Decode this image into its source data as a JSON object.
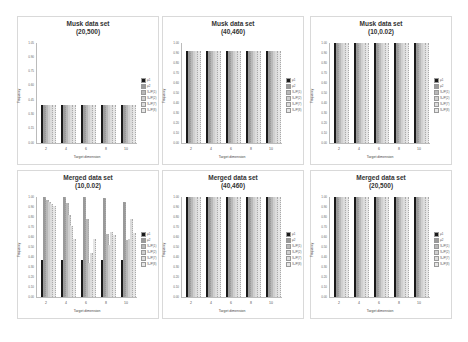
{
  "panels": [
    {
      "id": "p1",
      "title1": "Musk data set",
      "title2": "(20,500)",
      "x": 17,
      "y": 16,
      "ymax": 1.05,
      "yticks": [
        "0.00",
        "0.15",
        "0.30",
        "0.45",
        "0.60",
        "0.75",
        "0.90",
        "1.05"
      ]
    },
    {
      "id": "p2",
      "title1": "Musk data set",
      "title2": "(40,460)",
      "x": 162,
      "y": 16,
      "ymax": 1.0,
      "yticks": [
        "0.00",
        "0.10",
        "0.20",
        "0.30",
        "0.40",
        "0.50",
        "0.60",
        "0.70",
        "0.80",
        "0.90",
        "1.00"
      ]
    },
    {
      "id": "p3",
      "title1": "Musk data set",
      "title2": "(10,0.02)",
      "x": 310,
      "y": 16,
      "ymax": 1.0,
      "yticks": [
        "0.00",
        "0.10",
        "0.20",
        "0.30",
        "0.40",
        "0.50",
        "0.60",
        "0.70",
        "0.80",
        "0.90",
        "1.00"
      ]
    },
    {
      "id": "p4",
      "title1": "Merged data set",
      "title2": "(10,0.02)",
      "x": 17,
      "y": 170,
      "ymax": 1.0,
      "yticks": [
        "0.00",
        "0.10",
        "0.20",
        "0.30",
        "0.40",
        "0.50",
        "0.60",
        "0.70",
        "0.80",
        "0.90",
        "1.00"
      ]
    },
    {
      "id": "p5",
      "title1": "Merged data set",
      "title2": "(40,460)",
      "x": 162,
      "y": 170,
      "ymax": 1.0,
      "yticks": [
        "0.00",
        "0.10",
        "0.20",
        "0.30",
        "0.40",
        "0.50",
        "0.60",
        "0.70",
        "0.80",
        "0.90",
        "1.00"
      ]
    },
    {
      "id": "p6",
      "title1": "Merged data set",
      "title2": "(20,500)",
      "x": 310,
      "y": 170,
      "ymax": 1.0,
      "yticks": [
        "0.00",
        "0.10",
        "0.20",
        "0.30",
        "0.40",
        "0.50",
        "0.60",
        "0.70",
        "0.80",
        "0.90",
        "1.00"
      ]
    }
  ],
  "legend": [
    "μ1",
    "μ2",
    "S₁/P(1)",
    "S₁/P(2)",
    "S₁/P(7)",
    "S₁/P(8)"
  ],
  "series_colors": [
    "#1a1a1a",
    "#9a9a9a",
    "#b8b8b8",
    "#cfcfcf",
    "#dcdcdc",
    "#e6e6e6"
  ],
  "xlabel": "Target dimension",
  "ylabel": "Frequency",
  "chart_data": [
    {
      "type": "bar",
      "title": "Musk data set (20,500)",
      "xlabel": "Target dimension",
      "ylabel": "Frequency",
      "categories": [
        "2",
        "4",
        "6",
        "8",
        "10"
      ],
      "ylim": [
        0,
        1.05
      ],
      "legend_position": "right",
      "series": [
        {
          "name": "μ1",
          "values": [
            0.4,
            0.4,
            0.4,
            0.4,
            0.4
          ]
        },
        {
          "name": "μ2",
          "values": [
            0.4,
            0.4,
            0.4,
            0.4,
            0.4
          ]
        },
        {
          "name": "S₁/P(1)",
          "values": [
            0.4,
            0.4,
            0.4,
            0.4,
            0.4
          ]
        },
        {
          "name": "S₁/P(2)",
          "values": [
            0.4,
            0.4,
            0.4,
            0.4,
            0.4
          ]
        },
        {
          "name": "S₁/P(7)",
          "values": [
            0.4,
            0.4,
            0.4,
            0.4,
            0.4
          ]
        },
        {
          "name": "S₁/P(8)",
          "values": [
            0.4,
            0.4,
            0.4,
            0.4,
            0.4
          ]
        }
      ]
    },
    {
      "type": "bar",
      "title": "Musk data set (40,460)",
      "xlabel": "Target dimension",
      "ylabel": "Frequency",
      "categories": [
        "2",
        "4",
        "6",
        "8",
        "10"
      ],
      "ylim": [
        0,
        1.0
      ],
      "legend_position": "right",
      "series": [
        {
          "name": "μ1",
          "values": [
            0.92,
            0.92,
            0.92,
            0.92,
            0.92
          ]
        },
        {
          "name": "μ2",
          "values": [
            0.92,
            0.92,
            0.92,
            0.92,
            0.92
          ]
        },
        {
          "name": "S₁/P(1)",
          "values": [
            0.92,
            0.92,
            0.92,
            0.92,
            0.92
          ]
        },
        {
          "name": "S₁/P(2)",
          "values": [
            0.92,
            0.92,
            0.92,
            0.92,
            0.92
          ]
        },
        {
          "name": "S₁/P(7)",
          "values": [
            0.92,
            0.92,
            0.92,
            0.92,
            0.92
          ]
        },
        {
          "name": "S₁/P(8)",
          "values": [
            0.92,
            0.92,
            0.92,
            0.92,
            0.92
          ]
        }
      ]
    },
    {
      "type": "bar",
      "title": "Musk data set (10,0.02)",
      "xlabel": "Target dimension",
      "ylabel": "Frequency",
      "categories": [
        "2",
        "4",
        "6",
        "8",
        "10"
      ],
      "ylim": [
        0,
        1.0
      ],
      "legend_position": "right",
      "series": [
        {
          "name": "μ1",
          "values": [
            1.0,
            1.0,
            1.0,
            1.0,
            1.0
          ]
        },
        {
          "name": "μ2",
          "values": [
            1.0,
            1.0,
            1.0,
            1.0,
            1.0
          ]
        },
        {
          "name": "S₁/P(1)",
          "values": [
            1.0,
            1.0,
            1.0,
            1.0,
            1.0
          ]
        },
        {
          "name": "S₁/P(2)",
          "values": [
            1.0,
            1.0,
            1.0,
            1.0,
            1.0
          ]
        },
        {
          "name": "S₁/P(7)",
          "values": [
            1.0,
            1.0,
            1.0,
            1.0,
            1.0
          ]
        },
        {
          "name": "S₁/P(8)",
          "values": [
            1.0,
            1.0,
            1.0,
            1.0,
            1.0
          ]
        }
      ]
    },
    {
      "type": "bar",
      "title": "Merged data set (10,0.02)",
      "xlabel": "Target dimension",
      "ylabel": "Frequency",
      "categories": [
        "2",
        "4",
        "6",
        "8",
        "10"
      ],
      "ylim": [
        0,
        1.0
      ],
      "legend_position": "right",
      "series": [
        {
          "name": "μ1",
          "values": [
            0.37,
            0.37,
            0.37,
            0.37,
            0.37
          ]
        },
        {
          "name": "μ2",
          "values": [
            1.0,
            1.0,
            1.0,
            0.99,
            0.95
          ]
        },
        {
          "name": "S₁/P(1)",
          "values": [
            0.97,
            0.94,
            0.78,
            0.63,
            0.57
          ]
        },
        {
          "name": "S₁/P(2)",
          "values": [
            0.95,
            0.82,
            0.34,
            0.52,
            0.58
          ]
        },
        {
          "name": "S₁/P(7)",
          "values": [
            0.93,
            0.71,
            0.44,
            0.65,
            0.78
          ]
        },
        {
          "name": "S₁/P(8)",
          "values": [
            0.91,
            0.58,
            0.58,
            0.62,
            0.64
          ]
        }
      ]
    },
    {
      "type": "bar",
      "title": "Merged data set (40,460)",
      "xlabel": "Target dimension",
      "ylabel": "Frequency",
      "categories": [
        "2",
        "4",
        "6",
        "8",
        "10"
      ],
      "ylim": [
        0,
        1.0
      ],
      "legend_position": "right",
      "series": [
        {
          "name": "μ1",
          "values": [
            1.0,
            1.0,
            1.0,
            1.0,
            1.0
          ]
        },
        {
          "name": "μ2",
          "values": [
            1.0,
            1.0,
            1.0,
            1.0,
            1.0
          ]
        },
        {
          "name": "S₁/P(1)",
          "values": [
            1.0,
            1.0,
            1.0,
            1.0,
            1.0
          ]
        },
        {
          "name": "S₁/P(2)",
          "values": [
            1.0,
            1.0,
            1.0,
            1.0,
            1.0
          ]
        },
        {
          "name": "S₁/P(7)",
          "values": [
            1.0,
            1.0,
            1.0,
            1.0,
            1.0
          ]
        },
        {
          "name": "S₁/P(8)",
          "values": [
            1.0,
            1.0,
            1.0,
            1.0,
            1.0
          ]
        }
      ]
    },
    {
      "type": "bar",
      "title": "Merged data set (20,500)",
      "xlabel": "Target dimension",
      "ylabel": "Frequency",
      "categories": [
        "2",
        "4",
        "6",
        "8",
        "10"
      ],
      "ylim": [
        0,
        1.0
      ],
      "legend_position": "right",
      "series": [
        {
          "name": "μ1",
          "values": [
            1.0,
            1.0,
            1.0,
            1.0,
            1.0
          ]
        },
        {
          "name": "μ2",
          "values": [
            1.0,
            1.0,
            1.0,
            1.0,
            1.0
          ]
        },
        {
          "name": "S₁/P(1)",
          "values": [
            1.0,
            1.0,
            1.0,
            1.0,
            1.0
          ]
        },
        {
          "name": "S₁/P(2)",
          "values": [
            1.0,
            1.0,
            1.0,
            1.0,
            1.0
          ]
        },
        {
          "name": "S₁/P(7)",
          "values": [
            1.0,
            1.0,
            1.0,
            1.0,
            1.0
          ]
        },
        {
          "name": "S₁/P(8)",
          "values": [
            1.0,
            1.0,
            1.0,
            1.0,
            1.0
          ]
        }
      ]
    }
  ]
}
